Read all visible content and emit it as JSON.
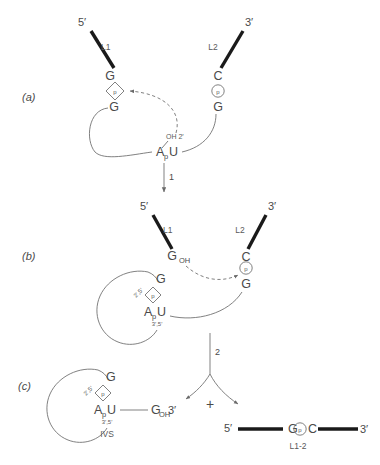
{
  "figure": {
    "background_color": "#ffffff",
    "ink_color": "#4a4a4a",
    "exon_color": "#1a1a1a"
  },
  "panels": [
    {
      "id": "a",
      "label": "(a)",
      "five_prime": "5′",
      "three_prime": "3′",
      "exon1_name": "L1",
      "exon2_name": "L2",
      "left_base_top": "G",
      "left_phosphate": "p",
      "left_base_bottom": "G",
      "right_base_top": "C",
      "right_phosphate": "p",
      "right_base_bottom": "G",
      "branch_point": "A",
      "branch_p": "p",
      "branch_u": "U",
      "hydroxyl_label": "OH 2′",
      "step_label": "1"
    },
    {
      "id": "b",
      "label": "(b)",
      "five_prime": "5′",
      "three_prime": "3′",
      "exon1_name": "L1",
      "exon2_name": "L2",
      "left_base": "G",
      "left_base_sub": "OH",
      "right_base_top": "C",
      "right_phosphate": "p",
      "right_base_bottom": "G",
      "lariat_base": "G",
      "lariat_phosphate": "p",
      "linkage_25": "2′,5′",
      "branch_point": "A",
      "branch_p": "p",
      "branch_u": "U",
      "linkage_35": "3′,5′",
      "step_label": "2"
    },
    {
      "id": "c",
      "label": "(c)",
      "lariat_base": "G",
      "lariat_phosphate": "p",
      "linkage_25": "2′,5′",
      "branch_point": "A",
      "branch_p": "p",
      "branch_u": "U",
      "linkage_35": "3′,5′",
      "ivs_label": "IVS",
      "tail_base": "G",
      "tail_sub": "OH",
      "tail_three_prime": "3′",
      "plus_sign": "+",
      "product_five_prime": "5′",
      "product_three_prime": "3′",
      "product_base_left": "G",
      "product_phosphate": "p",
      "product_base_right": "C",
      "product_name": "L1-2"
    }
  ]
}
